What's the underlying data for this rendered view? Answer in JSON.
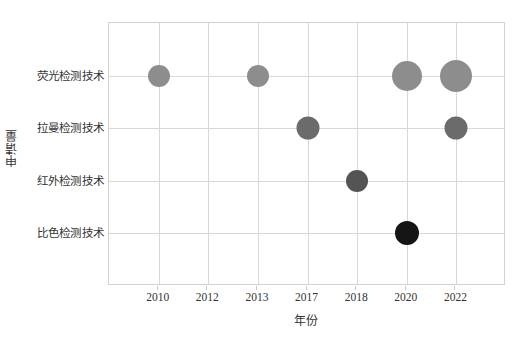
{
  "chart_data": {
    "type": "scatter",
    "title": "",
    "xlabel": "年份",
    "ylabel": "申请量",
    "x_categories": [
      "2010",
      "2012",
      "2013",
      "2017",
      "2018",
      "2020",
      "2022"
    ],
    "y_categories": [
      "荧光检测技术",
      "拉曼检测技术",
      "红外检测技术",
      "比色检测技术"
    ],
    "grid": true,
    "legend": "none",
    "note": "Bubble chart: bubble size encodes 申请量 (application volume); color darkens by category.",
    "points": [
      {
        "x": "2010",
        "y": "荧光检测技术",
        "size_px": 22,
        "color": "#8d8d8d"
      },
      {
        "x": "2013",
        "y": "荧光检测技术",
        "size_px": 22,
        "color": "#8d8d8d"
      },
      {
        "x": "2020",
        "y": "荧光检测技术",
        "size_px": 30,
        "color": "#8d8d8d"
      },
      {
        "x": "2022",
        "y": "荧光检测技术",
        "size_px": 32,
        "color": "#8d8d8d"
      },
      {
        "x": "2017",
        "y": "拉曼检测技术",
        "size_px": 23,
        "color": "#6b6b6b"
      },
      {
        "x": "2022",
        "y": "拉曼检测技术",
        "size_px": 23,
        "color": "#6b6b6b"
      },
      {
        "x": "2018",
        "y": "红外检测技术",
        "size_px": 22,
        "color": "#545454"
      },
      {
        "x": "2020",
        "y": "比色检测技术",
        "size_px": 24,
        "color": "#151515"
      }
    ],
    "colors": {
      "fluorescence": "#8d8d8d",
      "raman": "#6b6b6b",
      "infrared": "#545454",
      "colorimetric": "#151515",
      "grid": "#d8d8d8",
      "frame": "#d2d2d2",
      "background": "#ffffff",
      "text": "#333333"
    }
  }
}
